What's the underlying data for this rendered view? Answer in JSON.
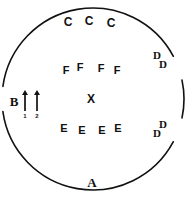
{
  "diagram": {
    "stroke_color": "#111111",
    "background_color": "#ffffff",
    "circle": {
      "center_x": 93,
      "center_y": 99,
      "radius": 91,
      "stroke_width": 1.6
    },
    "markers": [
      {
        "id": "c1",
        "label": "C",
        "x": 68,
        "y": 22,
        "class": "marker-c"
      },
      {
        "id": "c2",
        "label": "C",
        "x": 89,
        "y": 21,
        "class": "marker-c"
      },
      {
        "id": "c3",
        "label": "C",
        "x": 111,
        "y": 23,
        "class": "marker-c"
      },
      {
        "id": "f1",
        "label": "F",
        "x": 66,
        "y": 70,
        "class": "marker-f"
      },
      {
        "id": "f2",
        "label": "F",
        "x": 80,
        "y": 67,
        "class": "marker-f"
      },
      {
        "id": "f3",
        "label": "F",
        "x": 101,
        "y": 68,
        "class": "marker-f"
      },
      {
        "id": "f4",
        "label": "F",
        "x": 117,
        "y": 70,
        "class": "marker-f"
      },
      {
        "id": "x1",
        "label": "X",
        "x": 91,
        "y": 99,
        "class": "marker-x"
      },
      {
        "id": "e1",
        "label": "E",
        "x": 64,
        "y": 128,
        "class": "marker-e"
      },
      {
        "id": "e2",
        "label": "E",
        "x": 82,
        "y": 130,
        "class": "marker-e"
      },
      {
        "id": "e3",
        "label": "E",
        "x": 102,
        "y": 130,
        "class": "marker-e"
      },
      {
        "id": "e4",
        "label": "E",
        "x": 118,
        "y": 128,
        "class": "marker-e"
      },
      {
        "id": "d1",
        "label": "D",
        "x": 157,
        "y": 55,
        "class": "marker-d"
      },
      {
        "id": "d2",
        "label": "D",
        "x": 163,
        "y": 64,
        "class": "marker-d"
      },
      {
        "id": "d3",
        "label": "D",
        "x": 163,
        "y": 124,
        "class": "marker-d"
      },
      {
        "id": "d4",
        "label": "D",
        "x": 157,
        "y": 133,
        "class": "marker-d"
      },
      {
        "id": "b1",
        "label": "B",
        "x": 14,
        "y": 101,
        "class": "marker-b"
      },
      {
        "id": "a1",
        "label": "A",
        "x": 92,
        "y": 182,
        "class": "marker-a"
      }
    ],
    "arrows": [
      {
        "id": "arrow-1",
        "index_label": "1",
        "x": 4,
        "tip_y": 0,
        "tail_y": 21
      },
      {
        "id": "arrow-2",
        "index_label": "2",
        "x": 16,
        "tip_y": 0,
        "tail_y": 21
      }
    ],
    "circle_gaps": [
      {
        "id": "gap-left",
        "start_deg": 172,
        "end_deg": 188
      },
      {
        "id": "gap-upper-right",
        "start_deg": 332,
        "end_deg": 348
      },
      {
        "id": "gap-lower-right",
        "start_deg": 12,
        "end_deg": 28
      }
    ]
  }
}
